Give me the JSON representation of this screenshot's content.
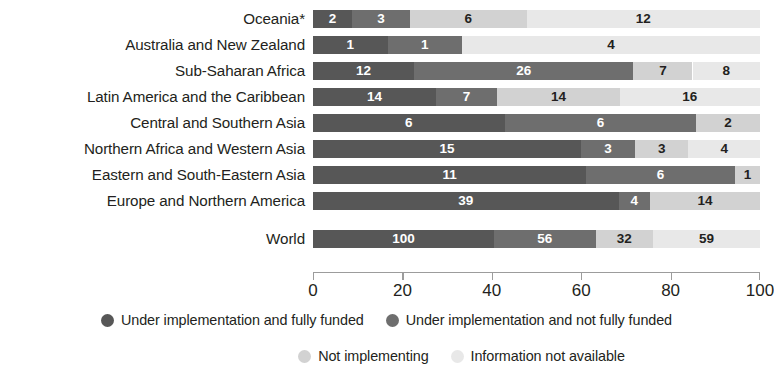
{
  "chart_data": {
    "type": "bar",
    "orientation": "horizontal",
    "stacked": true,
    "title": "",
    "subtitle": "",
    "xlabel": "",
    "ylabel": "",
    "xlim": [
      0,
      100
    ],
    "grid": false,
    "legend_position": "bottom",
    "axis_ticks": [
      0,
      20,
      40,
      60,
      80,
      100
    ],
    "axis_tick_labels": [
      "0",
      "20",
      "40",
      "60",
      "80",
      "100"
    ],
    "categories": [
      "Oceania*",
      "Australia and New Zealand",
      "Sub-Saharan Africa",
      "Latin America and the Caribbean",
      "Central and Southern Asia",
      "Northern Africa and Western Asia",
      "Eastern and South-Eastern Asia",
      "Europe and Northern America",
      "World"
    ],
    "series": [
      {
        "name": "Under implementation and fully funded",
        "color": "#575757",
        "values": [
          2,
          1,
          12,
          14,
          6,
          15,
          11,
          39,
          100
        ]
      },
      {
        "name": "Under implementation and not fully funded",
        "color": "#6e6e6e",
        "values": [
          3,
          1,
          26,
          7,
          6,
          3,
          6,
          4,
          56
        ]
      },
      {
        "name": "Not implementing",
        "color": "#d2d2d2",
        "values": [
          6,
          0,
          7,
          14,
          2,
          3,
          1,
          14,
          32
        ]
      },
      {
        "name": "Information not available",
        "color": "#e8e8e8",
        "values": [
          12,
          4,
          8,
          16,
          0,
          4,
          0,
          0,
          59
        ]
      }
    ],
    "rows": [
      {
        "label": "Oceania*",
        "total": 23,
        "segments": [
          {
            "series": "Under implementation and fully funded",
            "value": 2,
            "label": "2",
            "pct_start": 0.0,
            "pct_end": 8.7,
            "color": "#575757",
            "text_color": "#ffffff",
            "show_label": true
          },
          {
            "series": "Under implementation and not fully funded",
            "value": 3,
            "label": "3",
            "pct_start": 8.7,
            "pct_end": 21.7,
            "color": "#6e6e6e",
            "text_color": "#ffffff",
            "show_label": true
          },
          {
            "series": "Not implementing",
            "value": 6,
            "label": "6",
            "pct_start": 21.7,
            "pct_end": 47.8,
            "color": "#d2d2d2",
            "text_color": "#231f20",
            "show_label": true
          },
          {
            "series": "Information not available",
            "value": 12,
            "label": "12",
            "pct_start": 47.8,
            "pct_end": 100.0,
            "color": "#e8e8e8",
            "text_color": "#231f20",
            "show_label": true
          }
        ]
      },
      {
        "label": "Australia and New Zealand",
        "total": 6,
        "segments": [
          {
            "series": "Under implementation and fully funded",
            "value": 1,
            "label": "1",
            "pct_start": 0.0,
            "pct_end": 16.7,
            "color": "#575757",
            "text_color": "#ffffff",
            "show_label": true
          },
          {
            "series": "Under implementation and not fully funded",
            "value": 1,
            "label": "1",
            "pct_start": 16.7,
            "pct_end": 33.3,
            "color": "#6e6e6e",
            "text_color": "#ffffff",
            "show_label": true
          },
          {
            "series": "Not implementing",
            "value": 0,
            "label": "",
            "pct_start": 33.3,
            "pct_end": 33.3,
            "color": "#d2d2d2",
            "text_color": "#231f20",
            "show_label": false
          },
          {
            "series": "Information not available",
            "value": 4,
            "label": "4",
            "pct_start": 33.3,
            "pct_end": 100.0,
            "color": "#e8e8e8",
            "text_color": "#231f20",
            "show_label": true
          }
        ]
      },
      {
        "label": "Sub-Saharan Africa",
        "total": 53,
        "segments": [
          {
            "series": "Under implementation and fully funded",
            "value": 12,
            "label": "12",
            "pct_start": 0.0,
            "pct_end": 22.6,
            "color": "#575757",
            "text_color": "#ffffff",
            "show_label": true
          },
          {
            "series": "Under implementation and not fully funded",
            "value": 26,
            "label": "26",
            "pct_start": 22.6,
            "pct_end": 71.7,
            "color": "#6e6e6e",
            "text_color": "#ffffff",
            "show_label": true
          },
          {
            "series": "Not implementing",
            "value": 7,
            "label": "7",
            "pct_start": 71.7,
            "pct_end": 84.9,
            "color": "#d2d2d2",
            "text_color": "#231f20",
            "show_label": true
          },
          {
            "series": "Information not available",
            "value": 8,
            "label": "8",
            "pct_start": 84.9,
            "pct_end": 100.0,
            "color": "#e8e8e8",
            "text_color": "#231f20",
            "show_label": true
          }
        ]
      },
      {
        "label": "Latin America and the Caribbean",
        "total": 51,
        "segments": [
          {
            "series": "Under implementation and fully funded",
            "value": 14,
            "label": "14",
            "pct_start": 0.0,
            "pct_end": 27.5,
            "color": "#575757",
            "text_color": "#ffffff",
            "show_label": true
          },
          {
            "series": "Under implementation and not fully funded",
            "value": 7,
            "label": "7",
            "pct_start": 27.5,
            "pct_end": 41.2,
            "color": "#6e6e6e",
            "text_color": "#ffffff",
            "show_label": true
          },
          {
            "series": "Not implementing",
            "value": 14,
            "label": "14",
            "pct_start": 41.2,
            "pct_end": 68.6,
            "color": "#d2d2d2",
            "text_color": "#231f20",
            "show_label": true
          },
          {
            "series": "Information not available",
            "value": 16,
            "label": "16",
            "pct_start": 68.6,
            "pct_end": 100.0,
            "color": "#e8e8e8",
            "text_color": "#231f20",
            "show_label": true
          }
        ]
      },
      {
        "label": "Central and Southern Asia",
        "total": 14,
        "segments": [
          {
            "series": "Under implementation and fully funded",
            "value": 6,
            "label": "6",
            "pct_start": 0.0,
            "pct_end": 42.9,
            "color": "#575757",
            "text_color": "#ffffff",
            "show_label": true
          },
          {
            "series": "Under implementation and not fully funded",
            "value": 6,
            "label": "6",
            "pct_start": 42.9,
            "pct_end": 85.7,
            "color": "#6e6e6e",
            "text_color": "#ffffff",
            "show_label": true
          },
          {
            "series": "Not implementing",
            "value": 2,
            "label": "2",
            "pct_start": 85.7,
            "pct_end": 100.0,
            "color": "#d2d2d2",
            "text_color": "#231f20",
            "show_label": true
          },
          {
            "series": "Information not available",
            "value": 0,
            "label": "",
            "pct_start": 100.0,
            "pct_end": 100.0,
            "color": "#e8e8e8",
            "text_color": "#231f20",
            "show_label": false
          }
        ]
      },
      {
        "label": "Northern Africa and Western Asia",
        "total": 25,
        "segments": [
          {
            "series": "Under implementation and fully funded",
            "value": 15,
            "label": "15",
            "pct_start": 0.0,
            "pct_end": 60.0,
            "color": "#575757",
            "text_color": "#ffffff",
            "show_label": true
          },
          {
            "series": "Under implementation and not fully funded",
            "value": 3,
            "label": "3",
            "pct_start": 60.0,
            "pct_end": 72.0,
            "color": "#6e6e6e",
            "text_color": "#ffffff",
            "show_label": true
          },
          {
            "series": "Not implementing",
            "value": 3,
            "label": "3",
            "pct_start": 72.0,
            "pct_end": 84.0,
            "color": "#d2d2d2",
            "text_color": "#231f20",
            "show_label": true
          },
          {
            "series": "Information not available",
            "value": 4,
            "label": "4",
            "pct_start": 84.0,
            "pct_end": 100.0,
            "color": "#e8e8e8",
            "text_color": "#231f20",
            "show_label": true
          }
        ]
      },
      {
        "label": "Eastern and South-Eastern Asia",
        "total": 18,
        "segments": [
          {
            "series": "Under implementation and fully funded",
            "value": 11,
            "label": "11",
            "pct_start": 0.0,
            "pct_end": 61.1,
            "color": "#575757",
            "text_color": "#ffffff",
            "show_label": true
          },
          {
            "series": "Under implementation and not fully funded",
            "value": 6,
            "label": "6",
            "pct_start": 61.1,
            "pct_end": 94.4,
            "color": "#6e6e6e",
            "text_color": "#ffffff",
            "show_label": true
          },
          {
            "series": "Not implementing",
            "value": 1,
            "label": "1",
            "pct_start": 94.4,
            "pct_end": 100.0,
            "color": "#d2d2d2",
            "text_color": "#231f20",
            "show_label": true
          },
          {
            "series": "Information not available",
            "value": 0,
            "label": "",
            "pct_start": 100.0,
            "pct_end": 100.0,
            "color": "#e8e8e8",
            "text_color": "#231f20",
            "show_label": false
          }
        ]
      },
      {
        "label": "Europe and Northern America",
        "total": 57,
        "segments": [
          {
            "series": "Under implementation and fully funded",
            "value": 39,
            "label": "39",
            "pct_start": 0.0,
            "pct_end": 68.4,
            "color": "#575757",
            "text_color": "#ffffff",
            "show_label": true
          },
          {
            "series": "Under implementation and not fully funded",
            "value": 4,
            "label": "4",
            "pct_start": 68.4,
            "pct_end": 75.4,
            "color": "#6e6e6e",
            "text_color": "#ffffff",
            "show_label": true
          },
          {
            "series": "Not implementing",
            "value": 14,
            "label": "14",
            "pct_start": 75.4,
            "pct_end": 100.0,
            "color": "#d2d2d2",
            "text_color": "#231f20",
            "show_label": true
          },
          {
            "series": "Information not available",
            "value": 0,
            "label": "",
            "pct_start": 100.0,
            "pct_end": 100.0,
            "color": "#e8e8e8",
            "text_color": "#231f20",
            "show_label": false
          }
        ]
      },
      {
        "label": "World",
        "total": 247,
        "segments": [
          {
            "series": "Under implementation and fully funded",
            "value": 100,
            "label": "100",
            "pct_start": 0.0,
            "pct_end": 40.5,
            "color": "#575757",
            "text_color": "#ffffff",
            "show_label": true
          },
          {
            "series": "Under implementation and not fully funded",
            "value": 56,
            "label": "56",
            "pct_start": 40.5,
            "pct_end": 63.2,
            "color": "#6e6e6e",
            "text_color": "#ffffff",
            "show_label": true
          },
          {
            "series": "Not implementing",
            "value": 32,
            "label": "32",
            "pct_start": 63.2,
            "pct_end": 76.1,
            "color": "#d2d2d2",
            "text_color": "#231f20",
            "show_label": true
          },
          {
            "series": "Information not available",
            "value": 59,
            "label": "59",
            "pct_start": 76.1,
            "pct_end": 100.0,
            "color": "#e8e8e8",
            "text_color": "#231f20",
            "show_label": true
          }
        ]
      }
    ],
    "legend": [
      {
        "label": "Under implementation and fully funded",
        "color": "#575757"
      },
      {
        "label": "Under implementation and not fully funded",
        "color": "#6e6e6e"
      },
      {
        "label": "Not implementing",
        "color": "#d2d2d2"
      },
      {
        "label": "Information not available",
        "color": "#e8e8e8"
      }
    ]
  }
}
